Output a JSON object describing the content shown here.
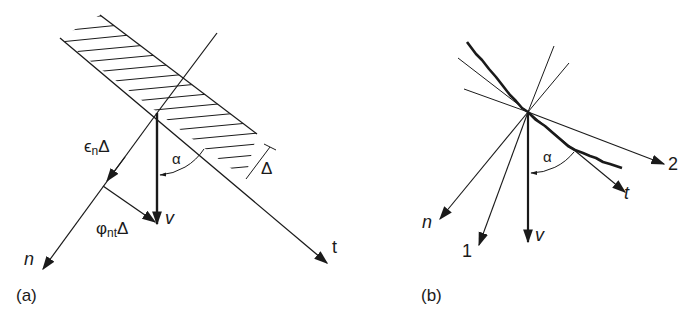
{
  "figure": {
    "panel_a": {
      "caption": "(a)",
      "labels": {
        "epsilon": "ϵ",
        "epsilon_sub": "n",
        "epsilon_delta": "Δ",
        "alpha": "α",
        "delta": "Δ",
        "phi": "φ",
        "phi_sub": "nt",
        "phi_delta": "Δ",
        "v": "v",
        "n": "n",
        "t": "t"
      }
    },
    "panel_b": {
      "caption": "(b)",
      "labels": {
        "alpha": "α",
        "n": "n",
        "one": "1",
        "v": "v",
        "t": "t",
        "two": "2"
      }
    },
    "colors": {
      "ink": "#1a1a1a",
      "background": "#ffffff"
    }
  }
}
